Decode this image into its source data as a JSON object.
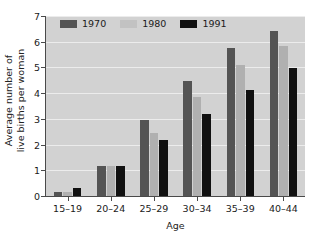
{
  "chart_data": {
    "type": "bar",
    "title": "",
    "xlabel": "Age",
    "ylabel": "Average number of live births per woman",
    "ylabel_line1": "Average number of",
    "ylabel_line2": "live births per woman",
    "categories": [
      "15–19",
      "20–24",
      "25–29",
      "30–34",
      "35–39",
      "40–44"
    ],
    "series": [
      {
        "name": "1970",
        "color": "#545454",
        "values": [
          0.15,
          1.17,
          2.95,
          4.47,
          5.75,
          6.4
        ]
      },
      {
        "name": "1980",
        "color": "#b0b0b0",
        "values": [
          0.15,
          1.15,
          2.45,
          3.85,
          5.08,
          5.85
        ]
      },
      {
        "name": "1991",
        "color": "#111111",
        "values": [
          0.3,
          1.17,
          2.18,
          3.2,
          4.13,
          4.98
        ]
      }
    ],
    "ylim": [
      0,
      7
    ],
    "yticks": [
      0,
      1,
      2,
      3,
      4,
      5,
      6,
      7
    ],
    "ytick_labels": [
      "0",
      "1",
      "2",
      "3",
      "4",
      "5",
      "6",
      "7"
    ],
    "grid": true,
    "grid_axis": "y",
    "legend_position": "top-left",
    "plot_background": "#d2d2d2",
    "figure_background": "#ffffff",
    "gridline_color": "#ececec",
    "axis_color": "#4a4a4a"
  },
  "legend": {
    "items": [
      {
        "label": "1970"
      },
      {
        "label": "1980"
      },
      {
        "label": "1991"
      }
    ]
  },
  "axes": {
    "x_title": "Age",
    "y_title_line1": "Average number of",
    "y_title_line2": "live births per woman"
  }
}
